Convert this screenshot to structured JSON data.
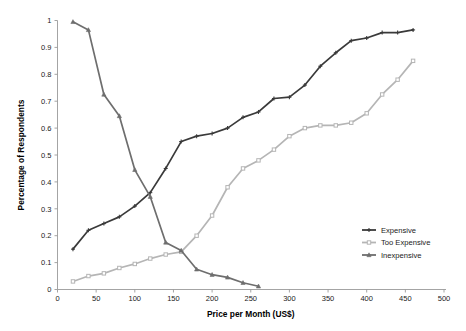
{
  "chart_data": {
    "type": "line",
    "title": "",
    "xlabel": "Price per Month (US$)",
    "ylabel": "Percentage of Respondents",
    "xlim": [
      0,
      500
    ],
    "ylim": [
      0,
      1
    ],
    "xticks": [
      0,
      50,
      100,
      150,
      200,
      250,
      300,
      350,
      400,
      450,
      500
    ],
    "xtick_labels": [
      "0",
      "50",
      "100",
      "150",
      "200",
      "250",
      "300",
      "350",
      "400",
      "450",
      "500"
    ],
    "yticks": [
      0,
      0.1,
      0.2,
      0.3,
      0.4,
      0.5,
      0.6,
      0.7,
      0.8,
      0.9,
      1
    ],
    "ytick_labels": [
      "0",
      "0.1",
      "0.2",
      "0.3",
      "0.4",
      "0.5",
      "0.6",
      "0.7",
      "0.8",
      "0.9",
      "1"
    ],
    "grid": false,
    "legend_position": "right-lower",
    "series": [
      {
        "name": "Expensive",
        "color": "#3a3a3a",
        "marker": "cross",
        "x": [
          20,
          40,
          60,
          80,
          100,
          120,
          140,
          160,
          180,
          200,
          220,
          240,
          260,
          280,
          300,
          320,
          340,
          360,
          380,
          400,
          420,
          440,
          460
        ],
        "y": [
          0.15,
          0.22,
          0.245,
          0.27,
          0.31,
          0.36,
          0.45,
          0.55,
          0.57,
          0.58,
          0.6,
          0.64,
          0.66,
          0.71,
          0.715,
          0.76,
          0.83,
          0.88,
          0.925,
          0.935,
          0.955,
          0.955,
          0.965
        ]
      },
      {
        "name": "Too Expensive",
        "color": "#b5b5b5",
        "marker": "square",
        "x": [
          20,
          40,
          60,
          80,
          100,
          120,
          140,
          160,
          180,
          200,
          220,
          240,
          260,
          280,
          300,
          320,
          340,
          360,
          380,
          400,
          420,
          440,
          460
        ],
        "y": [
          0.03,
          0.05,
          0.06,
          0.08,
          0.095,
          0.115,
          0.13,
          0.14,
          0.2,
          0.275,
          0.38,
          0.45,
          0.48,
          0.52,
          0.57,
          0.6,
          0.61,
          0.61,
          0.62,
          0.655,
          0.725,
          0.78,
          0.85
        ]
      },
      {
        "name": "Inexpensive",
        "color": "#6e6e6e",
        "marker": "triangle",
        "x": [
          20,
          40,
          60,
          80,
          100,
          120,
          140,
          160,
          180,
          200,
          220,
          240,
          260
        ],
        "y": [
          0.995,
          0.965,
          0.725,
          0.645,
          0.445,
          0.345,
          0.175,
          0.145,
          0.075,
          0.055,
          0.045,
          0.025,
          0.012
        ]
      }
    ]
  },
  "legend": {
    "items": [
      {
        "label": "Expensive"
      },
      {
        "label": "Too Expensive"
      },
      {
        "label": "Inexpensive"
      }
    ]
  },
  "axes": {
    "x_title": "Price per Month (US$)",
    "y_title": "Percentage of Respondents"
  }
}
